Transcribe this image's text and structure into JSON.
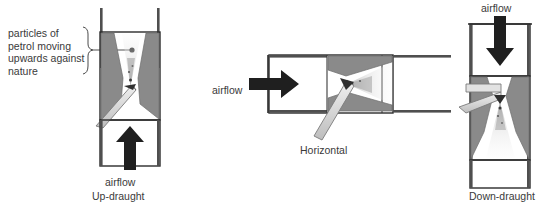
{
  "figure": {
    "background_color": "#ffffff",
    "ink_color": "#2b2b2b",
    "venturi_wall_color": "#8a8a8a",
    "venturi_wall_dark": "#7d7d7d",
    "nozzle_color": "#d9d9d9",
    "spray_color": "#e6e6e6",
    "arrow_color": "#262626"
  },
  "panels": [
    {
      "id": "up-draught",
      "name": "Up-draught carburettor",
      "annotation": "particles of petrol moving upwards against nature",
      "airflow_label": "airflow",
      "caption": "Up-draught",
      "airflow_direction": "up"
    },
    {
      "id": "horizontal",
      "name": "Horizontal carburettor",
      "annotation": "",
      "airflow_label": "airflow",
      "caption": "Horizontal",
      "airflow_direction": "right"
    },
    {
      "id": "down-draught",
      "name": "Down-draught carburettor",
      "annotation": "",
      "airflow_label": "airflow",
      "caption": "Down-draught",
      "airflow_direction": "down"
    }
  ],
  "labels": {
    "annotation_left": "particles of\npetrol moving\nupwards\nagainst nature",
    "airflow_up": "airflow",
    "caption_up": "Up-draught",
    "airflow_horizontal": "airflow",
    "caption_horizontal": "Horizontal",
    "airflow_down": "airflow",
    "caption_down": "Down-draught"
  },
  "icons": {
    "arrow_up": "arrow-up-icon",
    "arrow_right": "arrow-right-icon",
    "arrow_down": "arrow-down-icon",
    "brace": "curly-brace-icon",
    "leader": "leader-line-icon",
    "particle_dot": "particle-dot-icon"
  }
}
